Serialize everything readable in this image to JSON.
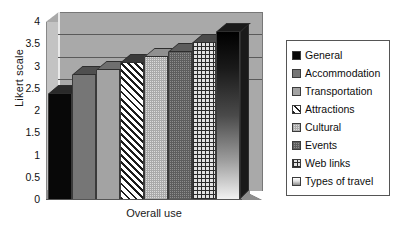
{
  "chart_data": {
    "type": "bar",
    "title": "",
    "xlabel": "Overall use",
    "ylabel": "Likert scale",
    "categories": [
      "General",
      "Accommodation",
      "Transportation",
      "Attractions",
      "Cultural",
      "Events",
      "Web links",
      "Types of travel"
    ],
    "values": [
      2.35,
      2.78,
      2.9,
      3.05,
      3.2,
      3.3,
      3.5,
      3.75
    ],
    "ylim": [
      0,
      4
    ],
    "yticks": [
      "0",
      "0.5",
      "1",
      "1.5",
      "2",
      "2.5",
      "3",
      "3.5",
      "4"
    ],
    "ytick_values": [
      0,
      0.5,
      1,
      1.5,
      2,
      2.5,
      3,
      3.5,
      4
    ],
    "grid": true,
    "legend_position": "right",
    "style": "3d-column",
    "series": [
      {
        "name": "Overall use",
        "values": [
          2.35,
          2.78,
          2.9,
          3.05,
          3.2,
          3.3,
          3.5,
          3.75
        ]
      }
    ],
    "fills": [
      "solid-black",
      "gray-med",
      "gray-light",
      "diagonal-hatch",
      "dot-light",
      "dot-dark",
      "grid-crosshatch",
      "gradient-black-white"
    ]
  },
  "legend": {
    "items": [
      {
        "label": "General",
        "fill": "solid-black"
      },
      {
        "label": "Accommodation",
        "fill": "gray-med"
      },
      {
        "label": "Transportation",
        "fill": "gray-light"
      },
      {
        "label": "Attractions",
        "fill": "diagonal-hatch"
      },
      {
        "label": "Cultural",
        "fill": "dot-light"
      },
      {
        "label": "Events",
        "fill": "dot-dark"
      },
      {
        "label": "Web links",
        "fill": "grid-crosshatch"
      },
      {
        "label": "Types of travel",
        "fill": "gradient-black-white"
      }
    ]
  },
  "colors": {
    "plot_background": "#a9a9a9",
    "gridline": "#5a5a5a",
    "axis_text": "#111111",
    "legend_border": "#555555",
    "page_background": "#ffffff"
  }
}
